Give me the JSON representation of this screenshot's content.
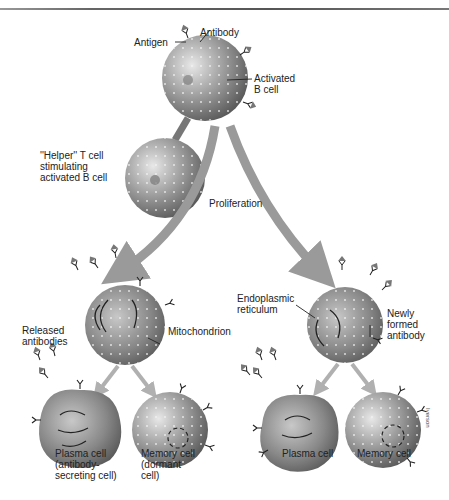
{
  "diagram": {
    "labels": {
      "antigen": "Antigen",
      "antibody": "Antibody",
      "activated_b_cell": "Activated\nB cell",
      "helper_t_cell": "''Helper'' T cell\nstimulating\nactivated B cell",
      "proliferation": "Proliferation",
      "released_antibodies": "Released\nantibodies",
      "mitochondrion": "Mitochondrion",
      "endoplasmic_reticulum": "Endoplasmic\nreticulum",
      "newly_formed_antibody": "Newly\nformed\nantibody",
      "plasma_cell_left": "Plasma cell\n(antibody-\nsecreting cell)",
      "memory_cell_left": "Memory cell\n(dormant\ncell)",
      "plasma_cell_right": "Plasma cell",
      "memory_cell_right": "Memory cell",
      "signature": "Iverson"
    },
    "colors": {
      "cell_light": "#d8d8d8",
      "cell_dark": "#6e6e6e",
      "arrow": "#9a9a9a",
      "text": "#222222"
    }
  }
}
